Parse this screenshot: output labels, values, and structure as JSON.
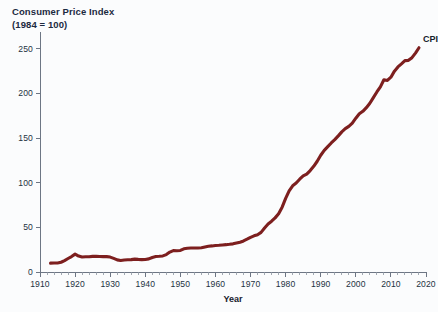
{
  "chart_data": {
    "type": "line",
    "title": "Consumer Price Index",
    "subtitle": "(1984 = 100)",
    "xlabel": "Year",
    "ylabel": "",
    "xlim": [
      1910,
      2020
    ],
    "ylim": [
      0,
      262
    ],
    "grid": false,
    "legend_position": "inline-end-of-line",
    "yticks": [
      0,
      50,
      100,
      150,
      200,
      250
    ],
    "ytick_labels": [
      "0",
      "50",
      "100",
      "150",
      "200",
      "250"
    ],
    "xticks": [
      1910,
      1920,
      1930,
      1940,
      1950,
      1960,
      1970,
      1980,
      1990,
      2000,
      2010,
      2020
    ],
    "xtick_labels": [
      "1910",
      "1920",
      "1930",
      "1940",
      "1950",
      "1960",
      "1970",
      "1980",
      "1990",
      "2000",
      "2010",
      "2020"
    ],
    "xtick_minor_step": 2,
    "series": [
      {
        "name": "CPI",
        "color": "#7d1f1f",
        "annotation": "CPI",
        "x": [
          1913,
          1914,
          1915,
          1916,
          1917,
          1918,
          1919,
          1920,
          1921,
          1922,
          1923,
          1924,
          1925,
          1926,
          1927,
          1928,
          1929,
          1930,
          1931,
          1932,
          1933,
          1934,
          1935,
          1936,
          1937,
          1938,
          1939,
          1940,
          1941,
          1942,
          1943,
          1944,
          1945,
          1946,
          1947,
          1948,
          1949,
          1950,
          1951,
          1952,
          1953,
          1954,
          1955,
          1956,
          1957,
          1958,
          1959,
          1960,
          1961,
          1962,
          1963,
          1964,
          1965,
          1966,
          1967,
          1968,
          1969,
          1970,
          1971,
          1972,
          1973,
          1974,
          1975,
          1976,
          1977,
          1978,
          1979,
          1980,
          1981,
          1982,
          1983,
          1984,
          1985,
          1986,
          1987,
          1988,
          1989,
          1990,
          1991,
          1992,
          1993,
          1994,
          1995,
          1996,
          1997,
          1998,
          1999,
          2000,
          2001,
          2002,
          2003,
          2004,
          2005,
          2006,
          2007,
          2008,
          2009,
          2010,
          2011,
          2012,
          2013,
          2014,
          2015,
          2016,
          2017,
          2018
        ],
        "values": [
          9.9,
          10.0,
          10.1,
          10.9,
          12.8,
          15.1,
          17.3,
          20.0,
          17.9,
          16.8,
          17.1,
          17.1,
          17.5,
          17.7,
          17.4,
          17.2,
          17.2,
          16.7,
          15.2,
          13.6,
          12.9,
          13.4,
          13.7,
          13.9,
          14.4,
          14.1,
          13.9,
          14.0,
          14.7,
          16.3,
          17.3,
          17.6,
          18.0,
          19.5,
          22.3,
          24.0,
          23.8,
          24.1,
          26.0,
          26.6,
          26.8,
          26.9,
          26.8,
          27.2,
          28.1,
          28.9,
          29.2,
          29.6,
          29.9,
          30.3,
          30.6,
          31.0,
          31.5,
          32.5,
          33.4,
          34.8,
          36.7,
          38.8,
          40.5,
          41.8,
          44.4,
          49.3,
          53.8,
          56.9,
          60.6,
          65.2,
          72.6,
          82.4,
          90.9,
          96.5,
          99.6,
          103.9,
          107.6,
          109.6,
          113.6,
          118.3,
          124.0,
          130.7,
          136.2,
          140.3,
          144.5,
          148.2,
          152.4,
          156.9,
          160.5,
          163.0,
          166.6,
          172.2,
          177.1,
          179.9,
          184.0,
          188.9,
          195.3,
          201.6,
          207.3,
          215.3,
          214.5,
          218.1,
          224.9,
          229.6,
          233.0,
          236.7,
          237.0,
          240.0,
          245.1,
          251.1
        ]
      }
    ]
  }
}
